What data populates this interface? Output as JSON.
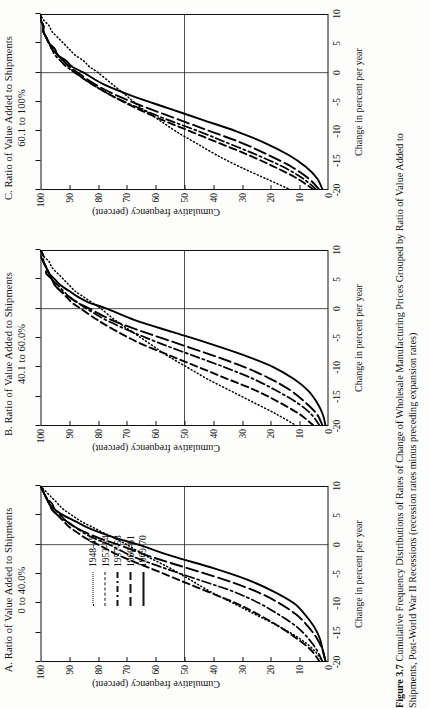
{
  "figure": {
    "number": "Figure 3.7",
    "caption_line1": "Cumulative Frequency Distributions of Rates of Change of Wholesale Manufacturing Prices Grouped by Ratio of Value Added to",
    "caption_line2": "Shipments, Post-World War II Recessions (recession rates minus preceding expansion rates)"
  },
  "axis": {
    "xlabel": "Change in percent per year",
    "ylabel": "Cumulative frequency (percent)",
    "xticks": [
      "-20",
      "-15",
      "-10",
      "-5",
      "0",
      "5",
      "10"
    ],
    "yticks": [
      "100",
      "90",
      "80",
      "70",
      "60",
      "50",
      "40",
      "30",
      "20",
      "10",
      "0"
    ],
    "xlim": [
      -20,
      10
    ],
    "ylim": [
      0,
      100
    ]
  },
  "legend": {
    "entries": [
      {
        "label": "1948-49",
        "style": "dotted"
      },
      {
        "label": "1953-54",
        "style": "dashed"
      },
      {
        "label": "1957-58",
        "style": "dash-dot"
      },
      {
        "label": "1960-61",
        "style": "long-dash"
      },
      {
        "label": "1969-70",
        "style": "solid"
      }
    ]
  },
  "panels": [
    {
      "id": "A",
      "title": "A.  Ratio of Value Added to Shipments",
      "subtitle": "0 to 40.0%"
    },
    {
      "id": "B",
      "title": "B.  Ratio of Value Added to Shipments",
      "subtitle": "40.1 to 60.0%"
    },
    {
      "id": "C",
      "title": "C.  Ratio of Value Added to Shipments",
      "subtitle": "60.1 to 100%"
    }
  ],
  "chart_data": {
    "type": "line",
    "title": "Cumulative Frequency Distributions of Rates of Change of Wholesale Manufacturing Prices",
    "xlabel": "Change in percent per year",
    "ylabel": "Cumulative frequency (percent)",
    "xlim": [
      -20,
      10
    ],
    "ylim": [
      0,
      100
    ],
    "grid": false,
    "legend_position": "upper-left-inside-panel-A",
    "panels": [
      {
        "id": "A",
        "label": "Ratio of Value Added to Shipments 0 to 40.0%",
        "series": [
          {
            "name": "1948-49",
            "style": "dotted",
            "x": [
              -20,
              -18,
              -16,
              -14,
              -12,
              -10,
              -8,
              -6,
              -4,
              -2,
              0,
              1,
              2,
              3,
              4,
              5,
              6,
              7,
              8,
              9,
              10
            ],
            "y": [
              2,
              5,
              10,
              17,
              25,
              33,
              41,
              48,
              55,
              63,
              70,
              74,
              78,
              82,
              86,
              89,
              92,
              94,
              96,
              98,
              100
            ]
          },
          {
            "name": "1953-54",
            "style": "dashed",
            "x": [
              -20,
              -18,
              -16,
              -14,
              -12,
              -10,
              -8,
              -6,
              -4,
              -2,
              0,
              1,
              2,
              3,
              4,
              5,
              6,
              7,
              8,
              9,
              10
            ],
            "y": [
              3,
              6,
              11,
              17,
              24,
              32,
              42,
              52,
              62,
              72,
              80,
              84,
              87,
              90,
              92,
              94,
              96,
              97,
              98,
              99,
              100
            ]
          },
          {
            "name": "1957-58",
            "style": "dash-dot",
            "x": [
              -20,
              -18,
              -16,
              -14,
              -12,
              -10,
              -8,
              -6,
              -4,
              -2,
              0,
              1,
              2,
              3,
              4,
              5,
              6,
              7,
              8,
              9,
              10
            ],
            "y": [
              2,
              4,
              7,
              11,
              17,
              24,
              33,
              45,
              57,
              68,
              76,
              81,
              85,
              88,
              91,
              93,
              95,
              96,
              98,
              99,
              100
            ]
          },
          {
            "name": "1960-61",
            "style": "long-dash",
            "x": [
              -20,
              -18,
              -16,
              -14,
              -12,
              -10,
              -8,
              -6,
              -4,
              -2,
              0,
              1,
              2,
              3,
              4,
              5,
              6,
              7,
              8,
              9,
              10
            ],
            "y": [
              1,
              2,
              4,
              7,
              11,
              17,
              25,
              36,
              49,
              62,
              73,
              79,
              84,
              88,
              91,
              94,
              96,
              97,
              98,
              99,
              100
            ]
          },
          {
            "name": "1969-70",
            "style": "solid",
            "x": [
              -20,
              -18,
              -16,
              -14,
              -12,
              -10,
              -8,
              -6,
              -4,
              -2,
              0,
              1,
              2,
              3,
              4,
              5,
              6,
              7,
              8,
              9,
              10
            ],
            "y": [
              1,
              2,
              3,
              5,
              8,
              12,
              19,
              28,
              40,
              54,
              66,
              73,
              79,
              84,
              88,
              92,
              95,
              97,
              98,
              99,
              100
            ]
          }
        ]
      },
      {
        "id": "B",
        "label": "Ratio of Value Added to Shipments 40.1 to 60.0%",
        "series": [
          {
            "name": "1948-49",
            "style": "dotted",
            "x": [
              -20,
              -18,
              -16,
              -14,
              -12,
              -10,
              -8,
              -6,
              -4,
              -2,
              0,
              1,
              2,
              3,
              4,
              5,
              6,
              7,
              8,
              9,
              10
            ],
            "y": [
              11,
              18,
              26,
              34,
              42,
              49,
              56,
              62,
              68,
              74,
              79,
              82,
              85,
              88,
              90,
              92,
              94,
              96,
              97,
              99,
              100
            ]
          },
          {
            "name": "1953-54",
            "style": "dashed",
            "x": [
              -20,
              -18,
              -16,
              -14,
              -12,
              -10,
              -8,
              -6,
              -4,
              -2,
              0,
              1,
              2,
              3,
              4,
              5,
              6,
              7,
              8,
              9,
              10
            ],
            "y": [
              5,
              10,
              17,
              25,
              35,
              45,
              55,
              65,
              73,
              80,
              86,
              89,
              91,
              93,
              95,
              96,
              97,
              98,
              99,
              99,
              100
            ]
          },
          {
            "name": "1957-58",
            "style": "dash-dot",
            "x": [
              -20,
              -18,
              -16,
              -14,
              -12,
              -10,
              -8,
              -6,
              -4,
              -2,
              0,
              1,
              2,
              3,
              4,
              5,
              6,
              7,
              8,
              9,
              10
            ],
            "y": [
              3,
              6,
              11,
              18,
              26,
              36,
              47,
              58,
              68,
              77,
              84,
              87,
              90,
              92,
              94,
              96,
              97,
              98,
              99,
              99,
              100
            ]
          },
          {
            "name": "1960-61",
            "style": "long-dash",
            "x": [
              -20,
              -18,
              -16,
              -14,
              -12,
              -10,
              -8,
              -6,
              -4,
              -2,
              0,
              1,
              2,
              3,
              4,
              5,
              6,
              7,
              8,
              9,
              10
            ],
            "y": [
              2,
              4,
              8,
              13,
              20,
              29,
              40,
              52,
              64,
              75,
              83,
              87,
              90,
              93,
              95,
              96,
              98,
              98,
              99,
              100,
              100
            ]
          },
          {
            "name": "1969-70",
            "style": "solid",
            "x": [
              -20,
              -18,
              -16,
              -14,
              -12,
              -10,
              -8,
              -6,
              -4,
              -2,
              0,
              1,
              2,
              3,
              4,
              5,
              6,
              7,
              8,
              9,
              10
            ],
            "y": [
              1,
              2,
              4,
              7,
              12,
              19,
              29,
              41,
              54,
              67,
              77,
              83,
              87,
              90,
              93,
              95,
              97,
              98,
              99,
              100,
              100
            ]
          }
        ]
      },
      {
        "id": "C",
        "label": "Ratio of Value Added to Shipments 60.1 to 100%",
        "series": [
          {
            "name": "1948-49",
            "style": "dotted",
            "x": [
              -20,
              -18,
              -16,
              -14,
              -12,
              -10,
              -8,
              -6,
              -4,
              -2,
              0,
              1,
              2,
              3,
              4,
              5,
              6,
              7,
              8,
              9,
              10
            ],
            "y": [
              13,
              22,
              31,
              39,
              46,
              53,
              59,
              65,
              70,
              75,
              80,
              83,
              85,
              88,
              90,
              92,
              94,
              96,
              97,
              99,
              100
            ]
          },
          {
            "name": "1953-54",
            "style": "dashed",
            "x": [
              -20,
              -18,
              -16,
              -14,
              -12,
              -10,
              -8,
              -6,
              -4,
              -2,
              0,
              1,
              2,
              3,
              4,
              5,
              6,
              7,
              8,
              9,
              10
            ],
            "y": [
              5,
              11,
              19,
              28,
              38,
              48,
              58,
              67,
              75,
              82,
              88,
              90,
              92,
              94,
              95,
              97,
              98,
              99,
              99,
              100,
              100
            ]
          },
          {
            "name": "1957-58",
            "style": "dash-dot",
            "x": [
              -20,
              -18,
              -16,
              -14,
              -12,
              -10,
              -8,
              -6,
              -4,
              -2,
              0,
              1,
              2,
              3,
              4,
              5,
              6,
              7,
              8,
              9,
              10
            ],
            "y": [
              4,
              9,
              16,
              25,
              35,
              45,
              56,
              66,
              75,
              82,
              88,
              91,
              93,
              95,
              96,
              97,
              98,
              99,
              99,
              100,
              100
            ]
          },
          {
            "name": "1960-61",
            "style": "long-dash",
            "x": [
              -20,
              -18,
              -16,
              -14,
              -12,
              -10,
              -8,
              -6,
              -4,
              -2,
              0,
              1,
              2,
              3,
              4,
              5,
              6,
              7,
              8,
              9,
              10
            ],
            "y": [
              3,
              7,
              13,
              21,
              30,
              41,
              52,
              63,
              73,
              81,
              87,
              90,
              92,
              94,
              96,
              97,
              98,
              99,
              99,
              100,
              100
            ]
          },
          {
            "name": "1969-70",
            "style": "solid",
            "x": [
              -20,
              -18,
              -16,
              -14,
              -12,
              -10,
              -8,
              -6,
              -4,
              -2,
              0,
              1,
              2,
              3,
              4,
              5,
              6,
              7,
              8,
              9,
              10
            ],
            "y": [
              2,
              4,
              8,
              14,
              22,
              32,
              44,
              56,
              68,
              78,
              85,
              89,
              91,
              94,
              95,
              97,
              98,
              99,
              99,
              100,
              100
            ]
          }
        ]
      }
    ]
  }
}
